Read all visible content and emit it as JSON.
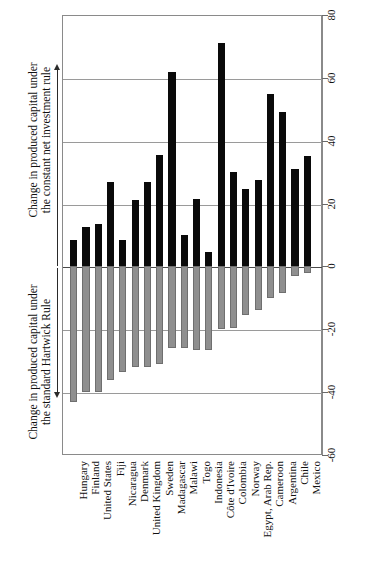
{
  "chart_data": {
    "type": "bar",
    "title": "",
    "subtitle": "",
    "xlabel": "",
    "ylabel_top": "Change in produced capital under the constant net investment rule",
    "ylabel_bottom": "Change in produced capital under the standard Hartwick Rule",
    "ylim": [
      -60,
      80
    ],
    "ytick_labels": [
      "80",
      "60",
      "40",
      "20",
      "0",
      "-20",
      "-40",
      "-60"
    ],
    "ytick_values": [
      80,
      60,
      40,
      20,
      0,
      -20,
      -40,
      -60
    ],
    "grid": true,
    "legend_position": "none",
    "categories": [
      "Hungary",
      "Finland",
      "United States",
      "Fiji",
      "Nicaragua",
      "Denmark",
      "United Kingdom",
      "Sweden",
      "Madagascar",
      "Malawi",
      "Togo",
      "Indonesia",
      "Côte d'Ivoire",
      "Colombia",
      "Norway",
      "Egypt, Arab Rep.",
      "Cameroon",
      "Argentina",
      "Chile",
      "Mexico"
    ],
    "series": [
      {
        "name": "Change in produced capital under the constant net investment rule",
        "color": "#0a0a0a",
        "values": [
          8.5,
          12.5,
          13.5,
          27,
          8.5,
          21,
          27,
          35.5,
          62,
          10,
          21.5,
          4.5,
          71,
          30,
          24.5,
          27.5,
          55,
          49,
          31,
          35
        ]
      },
      {
        "name": "Change in produced capital under the standard Hartwick Rule",
        "color": "#8f8f8f",
        "values": [
          -43,
          -40,
          -40,
          -36,
          -33.5,
          -32,
          -32,
          -31,
          -26,
          -26,
          -26.5,
          -26.5,
          -20,
          -19.5,
          -15.5,
          -14,
          -10,
          -8.5,
          -3,
          -2
        ]
      }
    ]
  },
  "axis": {
    "top_title_line1": "Change in produced capital under",
    "top_title_line2": "the constant net investment rule",
    "bottom_title_line1": "Change in produced capital under",
    "bottom_title_line2": "the standard Hartwick Rule",
    "up_arrow_icon": "arrow-up-icon",
    "down_arrow_icon": "arrow-down-icon"
  }
}
